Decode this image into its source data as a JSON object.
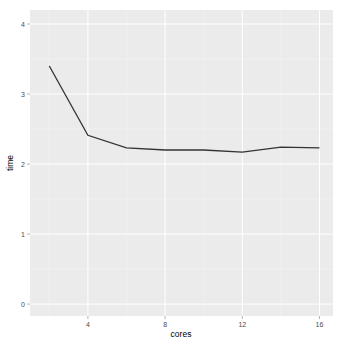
{
  "chart_data": {
    "type": "line",
    "title": "",
    "xlabel": "cores",
    "ylabel": "time",
    "x": [
      2,
      4,
      6,
      8,
      10,
      12,
      14,
      16
    ],
    "series": [
      {
        "name": "time",
        "values": [
          3.4,
          2.41,
          2.23,
          2.2,
          2.2,
          2.17,
          2.24,
          2.23
        ]
      }
    ],
    "xlim": [
      1,
      16.7
    ],
    "ylim": [
      -0.17,
      4.2
    ],
    "xticks": [
      4,
      8,
      12,
      16
    ],
    "xtick_labels": [
      "4",
      "8",
      "12",
      "16"
    ],
    "yticks": [
      0,
      1,
      2,
      3,
      4
    ],
    "ytick_labels": [
      "0",
      "1",
      "2",
      "3",
      "4"
    ],
    "grid": true,
    "legend": "none",
    "theme": {
      "panel_background": "#ebebeb",
      "grid_major": "#ffffff",
      "line_color": "#333333"
    }
  }
}
